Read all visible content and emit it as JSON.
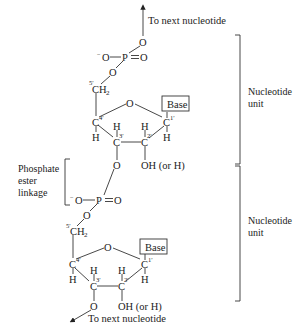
{
  "diagram": {
    "type": "chemical-structure",
    "top_arrow_label": "To next nucleotide",
    "bottom_arrow_label": "To next nucleotide",
    "side_labels": {
      "unit1_line1": "Nucleotide",
      "unit1_line2": "unit",
      "unit2_line1": "Nucleotide",
      "unit2_line2": "unit",
      "linkage_line1": "Phosphate",
      "linkage_line2": "ester",
      "linkage_line3": "linkage"
    },
    "atoms": {
      "O": "O",
      "P": "P",
      "neg_O": "O",
      "minus": "−",
      "CH": "CH",
      "two": "2",
      "H": "H",
      "C": "C",
      "base": "Base",
      "oh": "OH (or H)"
    },
    "primes": {
      "p1": "1′",
      "p2": "2′",
      "p3": "3′",
      "p4": "4′",
      "p5": "5′"
    },
    "units": [
      {
        "name": "nucleotide-unit-1",
        "base": "Base",
        "sugar_2_substituent": "OH (or H)"
      },
      {
        "name": "nucleotide-unit-2",
        "base": "Base",
        "sugar_2_substituent": "OH (or H)"
      }
    ]
  }
}
